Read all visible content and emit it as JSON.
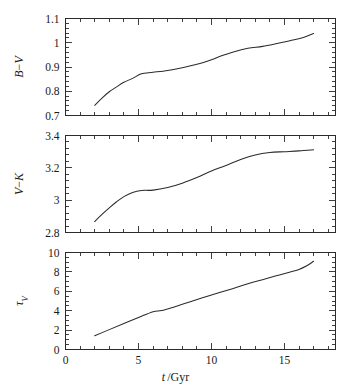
{
  "figure": {
    "name": "three-panel-evolution-figure",
    "background": "#ffffff",
    "ink": "#2b2b2b"
  },
  "axis": {
    "x_label": "t /Gyr",
    "x_label_main": "t",
    "x_label_rest": "/Gyr",
    "x_ticks": [
      "0",
      "5",
      "10",
      "15"
    ],
    "x_tick_values": [
      0,
      5,
      10,
      15
    ],
    "x_min": 0,
    "x_max": 18.5,
    "x_minor_step": 1
  },
  "panels": [
    {
      "id": "panel-bv",
      "ylabel": "B-V",
      "ylabel_part1": "B",
      "ylabel_dash": "−",
      "ylabel_part2": "V",
      "y_ticks": [
        "1.1",
        "1",
        "0.9",
        "0.8",
        "0.7"
      ],
      "y_tick_values": [
        1.1,
        1.0,
        0.9,
        0.8,
        0.7
      ],
      "y_min": 0.7,
      "y_max": 1.1,
      "y_minor_step": 0.02
    },
    {
      "id": "panel-vk",
      "ylabel": "V-K",
      "ylabel_part1": "V",
      "ylabel_dash": "−",
      "ylabel_part2": "K",
      "y_ticks": [
        "3.4",
        "3.2",
        "3",
        "2.8"
      ],
      "y_tick_values": [
        3.4,
        3.2,
        3.0,
        2.8
      ],
      "y_min": 2.8,
      "y_max": 3.4,
      "y_minor_step": 0.04
    },
    {
      "id": "panel-tauv",
      "ylabel": "τV",
      "ylabel_part1": "τ",
      "ylabel_part2": "V",
      "y_ticks": [
        "10",
        "8",
        "6",
        "4",
        "2",
        "0"
      ],
      "y_tick_values": [
        10,
        8,
        6,
        4,
        2,
        0
      ],
      "y_min": 0,
      "y_max": 10,
      "y_minor_step": 0.5
    }
  ],
  "chart_data": [
    {
      "type": "line",
      "title": "",
      "xlabel": "t /Gyr",
      "ylabel": "B-V",
      "xlim": [
        0,
        18.5
      ],
      "ylim": [
        0.7,
        1.1
      ],
      "grid": false,
      "legend": "none",
      "x": [
        2.0,
        2.5,
        3.0,
        3.5,
        4.0,
        4.6,
        5.2,
        6.0,
        7.0,
        8.0,
        9.0,
        10.0,
        10.6,
        11.5,
        12.5,
        13.5,
        14.5,
        15.5,
        16.3,
        17.0
      ],
      "y": [
        0.742,
        0.772,
        0.798,
        0.818,
        0.837,
        0.853,
        0.872,
        0.878,
        0.886,
        0.897,
        0.911,
        0.93,
        0.944,
        0.962,
        0.977,
        0.985,
        0.997,
        1.01,
        1.022,
        1.038
      ]
    },
    {
      "type": "line",
      "title": "",
      "xlabel": "t /Gyr",
      "ylabel": "V-K",
      "xlim": [
        0,
        18.5
      ],
      "ylim": [
        2.8,
        3.4
      ],
      "grid": false,
      "legend": "none",
      "x": [
        2.0,
        2.5,
        3.0,
        3.5,
        4.0,
        4.6,
        5.2,
        6.0,
        7.0,
        8.0,
        9.0,
        10.0,
        11.0,
        12.0,
        13.0,
        14.0,
        15.0,
        16.0,
        17.0
      ],
      "y": [
        2.868,
        2.912,
        2.952,
        2.99,
        3.022,
        3.048,
        3.06,
        3.062,
        3.078,
        3.105,
        3.14,
        3.18,
        3.215,
        3.252,
        3.28,
        3.295,
        3.3,
        3.305,
        3.312
      ]
    },
    {
      "type": "line",
      "title": "",
      "xlabel": "t /Gyr",
      "ylabel": "τV",
      "xlim": [
        0,
        18.5
      ],
      "ylim": [
        0,
        10
      ],
      "grid": false,
      "legend": "none",
      "x": [
        2.0,
        3.0,
        4.0,
        5.0,
        6.0,
        6.6,
        7.5,
        8.5,
        9.5,
        10.5,
        11.5,
        12.5,
        13.5,
        14.5,
        15.4,
        16.0,
        16.5,
        17.0
      ],
      "y": [
        1.42,
        2.05,
        2.68,
        3.3,
        3.9,
        4.02,
        4.42,
        4.9,
        5.38,
        5.85,
        6.3,
        6.78,
        7.2,
        7.62,
        8.0,
        8.25,
        8.6,
        9.1
      ]
    }
  ]
}
